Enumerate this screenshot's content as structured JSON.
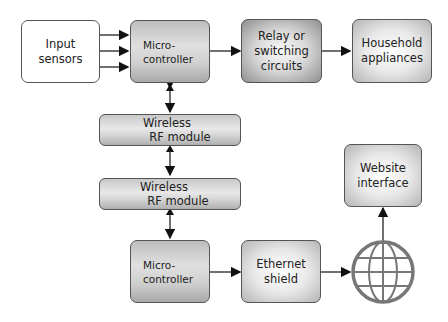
{
  "diagram": {
    "nodes": {
      "input_sensors": "Input\nsensors",
      "microcontroller_top": "Micro-\ncontroller",
      "relay": "Relay or\nswitching\ncircuits",
      "household": "Household\nappliances",
      "rf_module_top": {
        "line1": "Wireless",
        "line2": "RF module"
      },
      "rf_module_bottom": {
        "line1": "Wireless",
        "line2": "RF module"
      },
      "microcontroller_bottom": "Micro-\ncontroller",
      "ethernet": "Ethernet\nshield",
      "website": "Website\ninterface",
      "internet": "globe-icon"
    },
    "edges": [
      {
        "from": "input_sensors",
        "to": "microcontroller_top",
        "count": 3
      },
      {
        "from": "microcontroller_top",
        "to": "relay"
      },
      {
        "from": "relay",
        "to": "household"
      },
      {
        "from": "microcontroller_top",
        "to": "rf_module_top",
        "bidirectional": true
      },
      {
        "from": "rf_module_top",
        "to": "rf_module_bottom",
        "bidirectional": true
      },
      {
        "from": "rf_module_bottom",
        "to": "microcontroller_bottom"
      },
      {
        "from": "microcontroller_bottom",
        "to": "ethernet"
      },
      {
        "from": "ethernet",
        "to": "internet"
      },
      {
        "from": "internet",
        "to": "website"
      }
    ]
  }
}
